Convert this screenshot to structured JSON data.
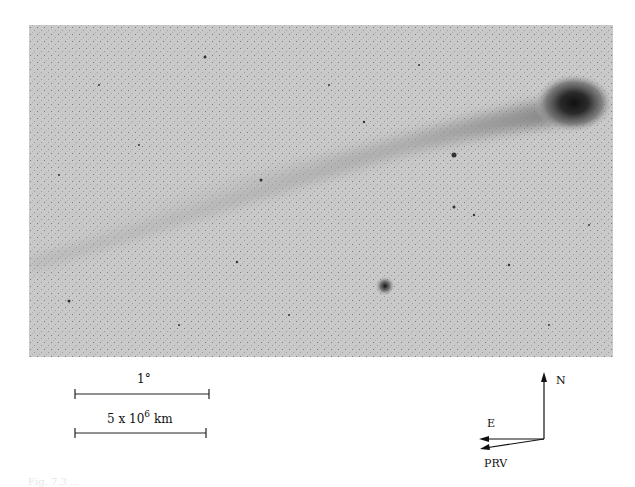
{
  "figure": {
    "image": {
      "subject": "comet with long ion tail, negative print",
      "features": [
        "comet-head",
        "ion-tail",
        "bright-star"
      ]
    },
    "scale_bars": {
      "angular": {
        "label": "1°"
      },
      "physical": {
        "label_prefix": "5 x 10",
        "exponent": "6",
        "unit": "km"
      }
    },
    "compass": {
      "north": "N",
      "east": "E",
      "velocity": "PRV"
    },
    "caption": "Fig. 7.3  ..."
  }
}
